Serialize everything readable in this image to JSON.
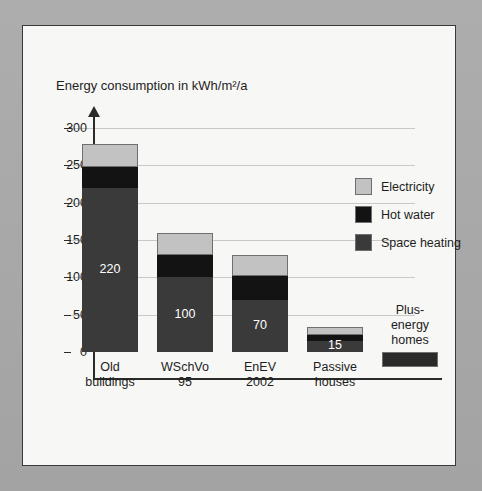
{
  "chart_data": {
    "type": "bar",
    "title": "Energy consumption in kWh/m²/a",
    "xlabel": "",
    "ylabel": "",
    "ylim": [
      -25,
      300
    ],
    "yticks": [
      0,
      50,
      100,
      150,
      200,
      250,
      300
    ],
    "grid": true,
    "stacked": true,
    "legend_position": "inside-top-right",
    "categories": [
      "Old buildings",
      "WSchVo 95",
      "EnEV 2002",
      "Passive houses",
      "Plus-energy homes"
    ],
    "series": [
      {
        "name": "Space heating",
        "color": "#3a3a3a",
        "values": [
          220,
          100,
          70,
          15,
          -20
        ]
      },
      {
        "name": "Hot water",
        "color": "#131313",
        "values": [
          28,
          30,
          32,
          8,
          0
        ]
      },
      {
        "name": "Electricity",
        "color": "#c2c2c2",
        "values": [
          30,
          30,
          28,
          10,
          0
        ]
      }
    ],
    "totals": [
      278,
      160,
      130,
      33,
      -20
    ],
    "data_labels": [
      "220",
      "100",
      "70",
      "15",
      ""
    ]
  },
  "axis": {
    "ytick_labels": [
      "300",
      "250",
      "200",
      "150",
      "100",
      "50",
      "0"
    ]
  },
  "categories_display": [
    {
      "line1": "Old",
      "line2": "buildings"
    },
    {
      "line1": "WSchVo",
      "line2": "95"
    },
    {
      "line1": "EnEV",
      "line2": "2002"
    },
    {
      "line1": "Passive",
      "line2": "houses"
    },
    {
      "line1": "Plus-",
      "line2": "energy",
      "line3": "homes"
    }
  ],
  "legend": {
    "items": [
      {
        "label": "Electricity",
        "color": "#c2c2c2"
      },
      {
        "label": "Hot water",
        "color": "#131313"
      },
      {
        "label": "Space heating",
        "color": "#3a3a3a"
      }
    ]
  }
}
